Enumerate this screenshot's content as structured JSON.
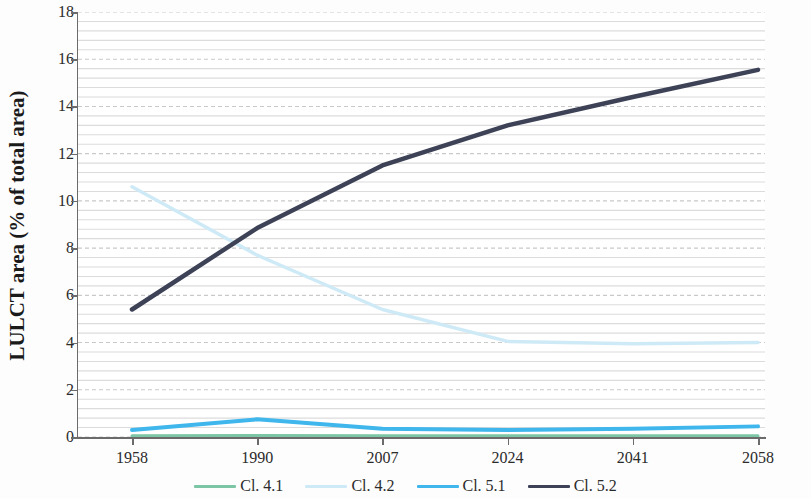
{
  "chart_data": {
    "type": "line",
    "title": "",
    "subtitle": "",
    "xlabel": "",
    "ylabel": "LULCT area (% of total area)",
    "categories": [
      "1958",
      "1990",
      "2007",
      "2024",
      "2041",
      "2058"
    ],
    "ylim": [
      0,
      18
    ],
    "xlim_categories": 6,
    "y_major_tick_interval": 2,
    "y_minor_tick_interval": 0.4,
    "y_tick_labels": [
      "0",
      "2",
      "4",
      "6",
      "8",
      "10",
      "12",
      "14",
      "16",
      "18"
    ],
    "y_tick_values": [
      0,
      2,
      4,
      6,
      8,
      10,
      12,
      14,
      16,
      18
    ],
    "grid": {
      "major_horizontal": true,
      "major_style": "dashed",
      "minor_horizontal": true,
      "minor_style": "solid",
      "vertical": false,
      "major_color": "#c9c9c9",
      "minor_color": "#dcdcdc"
    },
    "legend_position": "bottom-center",
    "series": [
      {
        "name": "Cl. 4.1",
        "color": "#7cc6a5",
        "width": 3,
        "values": [
          0.05,
          0.06,
          0.05,
          0.05,
          0.05,
          0.05
        ]
      },
      {
        "name": "Cl. 4.2",
        "color": "#cfeaf7",
        "width": 3.5,
        "values": [
          10.6,
          7.7,
          5.4,
          4.05,
          3.95,
          4.0
        ]
      },
      {
        "name": "Cl. 5.1",
        "color": "#3fb6ec",
        "width": 4,
        "values": [
          0.3,
          0.75,
          0.35,
          0.3,
          0.35,
          0.45
        ]
      },
      {
        "name": "Cl. 5.2",
        "color": "#3e4257",
        "width": 4.5,
        "values": [
          5.4,
          8.85,
          11.5,
          13.2,
          14.4,
          15.55
        ]
      }
    ]
  },
  "axes": {
    "y_axis_title": "LULCT area (% of total area)",
    "axis_line_color": "#6b6b6b"
  },
  "legend": {
    "items": [
      {
        "label": "Cl. 4.1",
        "color": "#7cc6a5"
      },
      {
        "label": "Cl. 4.2",
        "color": "#cfeaf7"
      },
      {
        "label": "Cl. 5.1",
        "color": "#3fb6ec"
      },
      {
        "label": "Cl. 5.2",
        "color": "#3e4257"
      }
    ]
  }
}
